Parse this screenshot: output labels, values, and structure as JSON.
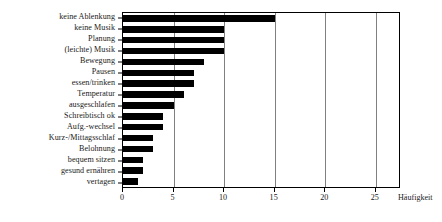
{
  "chart_data": {
    "type": "bar",
    "orientation": "horizontal",
    "title": "",
    "xlabel": "Häufigkeit",
    "ylabel": "",
    "xlim": [
      0,
      27.5
    ],
    "xticks": [
      0,
      5,
      10,
      15,
      20,
      25
    ],
    "xtick_labels": [
      "0",
      "5",
      "10",
      "15",
      "20",
      "25"
    ],
    "grid": true,
    "grid_axis": "x",
    "legend": false,
    "bar_color": "#000000",
    "categories": [
      "keine Ablenkung",
      "keine Musik",
      "Planung",
      "(leichte) Musik",
      "Bewegung",
      "Pausen",
      "essen/trinken",
      "Temperatur",
      "ausgeschlafen",
      "Schreibtisch ok",
      "Aufg.-wechsel",
      "Kurz-/Mittagsschlaf",
      "Belohnung",
      "bequem sitzen",
      "gesund ernähren",
      "vertagen"
    ],
    "values": [
      15,
      10,
      10,
      10,
      8,
      7,
      7,
      6,
      5,
      4,
      4,
      3,
      3,
      2,
      2,
      1.5
    ]
  }
}
